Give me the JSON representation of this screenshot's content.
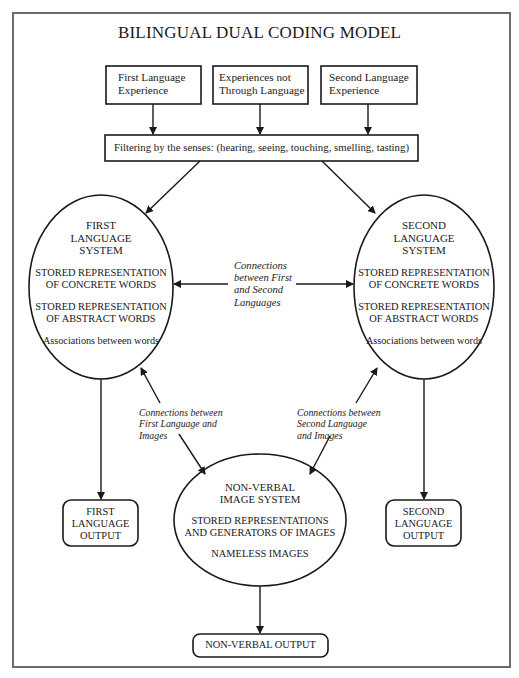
{
  "title": "BILINGUAL DUAL CODING MODEL",
  "inputs": [
    {
      "line1": "First Language",
      "line2": "Experience"
    },
    {
      "line1": "Experiences not",
      "line2": "Through Language"
    },
    {
      "line1": "Second Language",
      "line2": "Experience"
    }
  ],
  "filter": "Filtering by the senses: (hearing, seeing, touching, smelling, tasting)",
  "first_system": {
    "name": [
      "FIRST",
      "LANGUAGE",
      "SYSTEM"
    ],
    "concrete": [
      "STORED REPRESENTATION",
      "OF CONCRETE WORDS"
    ],
    "abstract": [
      "STORED REPRESENTATION",
      "OF ABSTRACT WORDS"
    ],
    "associations": "Associations between words"
  },
  "second_system": {
    "name": [
      "SECOND",
      "LANGUAGE",
      "SYSTEM"
    ],
    "concrete": [
      "STORED REPRESENTATION",
      "OF CONCRETE WORDS"
    ],
    "abstract": [
      "STORED REPRESENTATION",
      "OF ABSTRACT WORDS"
    ],
    "associations": "Associations between words"
  },
  "connections": {
    "first_second": [
      "Connections",
      "between First",
      "and Second",
      "Languages"
    ],
    "first_images": [
      "Connections between",
      "First Language and",
      "Images"
    ],
    "second_images": [
      "Connections between",
      "Second Language",
      "and Images"
    ]
  },
  "image_system": {
    "name": [
      "NON-VERBAL",
      "IMAGE SYSTEM"
    ],
    "stored": [
      "STORED REPRESENTATIONS",
      "AND GENERATORS OF IMAGES"
    ],
    "nameless": "NAMELESS IMAGES"
  },
  "outputs": {
    "first": [
      "FIRST",
      "LANGUAGE",
      "OUTPUT"
    ],
    "second": [
      "SECOND",
      "LANGUAGE",
      "OUTPUT"
    ],
    "nonverbal": "NON-VERBAL OUTPUT"
  }
}
